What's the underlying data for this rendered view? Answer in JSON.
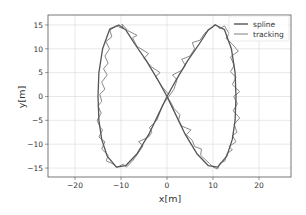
{
  "chart_data": {
    "type": "line",
    "title": "",
    "xlabel": "x[m]",
    "ylabel": "y[m]",
    "xlim": [
      -26,
      27
    ],
    "ylim": [
      -17,
      17
    ],
    "xticks": [
      -20,
      -10,
      0,
      10,
      20
    ],
    "yticks": [
      -15,
      -10,
      -5,
      0,
      5,
      10,
      15
    ],
    "xtick_labels": [
      "−20",
      "−10",
      "0",
      "10",
      "20"
    ],
    "ytick_labels": [
      "−15",
      "−10",
      "−5",
      "0",
      "5",
      "10",
      "15"
    ],
    "grid": true,
    "legend_position": "upper right",
    "series": [
      {
        "name": "spline",
        "color": "#555555",
        "width": 1.3,
        "points": [
          [
            0,
            0
          ],
          [
            -2,
            3.5
          ],
          [
            -4.5,
            7.5
          ],
          [
            -7,
            11
          ],
          [
            -9,
            14
          ],
          [
            -10.5,
            15
          ],
          [
            -12.5,
            14
          ],
          [
            -14,
            10
          ],
          [
            -14.8,
            5
          ],
          [
            -15,
            0
          ],
          [
            -14.8,
            -5
          ],
          [
            -14.2,
            -9
          ],
          [
            -13,
            -12.5
          ],
          [
            -11,
            -14.8
          ],
          [
            -9,
            -14.5
          ],
          [
            -6.5,
            -12
          ],
          [
            -4,
            -8
          ],
          [
            -2,
            -4
          ],
          [
            0,
            0
          ],
          [
            2,
            3.5
          ],
          [
            4.5,
            7.5
          ],
          [
            7,
            11
          ],
          [
            9,
            14
          ],
          [
            10.5,
            15
          ],
          [
            12.5,
            14
          ],
          [
            14,
            10
          ],
          [
            14.8,
            5
          ],
          [
            15,
            0
          ],
          [
            14.8,
            -5
          ],
          [
            14.2,
            -9
          ],
          [
            13,
            -12.5
          ],
          [
            11,
            -14.8
          ],
          [
            9,
            -14.5
          ],
          [
            6.5,
            -12
          ],
          [
            4,
            -8
          ],
          [
            2,
            -4
          ],
          [
            0,
            0
          ]
        ]
      },
      {
        "name": "tracking",
        "color": "#8a8a8a",
        "width": 1.0,
        "points": [
          [
            0.3,
            0.5
          ],
          [
            -1,
            2
          ],
          [
            -2.5,
            4.2
          ],
          [
            -1.5,
            5
          ],
          [
            -3.5,
            6.3
          ],
          [
            -5,
            8
          ],
          [
            -4,
            9
          ],
          [
            -6.5,
            10.5
          ],
          [
            -7.5,
            12.3
          ],
          [
            -6.5,
            12.8
          ],
          [
            -8.5,
            13.8
          ],
          [
            -9.8,
            15.2
          ],
          [
            -9.5,
            14.2
          ],
          [
            -11,
            14.8
          ],
          [
            -12.5,
            14.2
          ],
          [
            -12,
            12.5
          ],
          [
            -13.3,
            11.5
          ],
          [
            -12.5,
            10
          ],
          [
            -13.5,
            8.5
          ],
          [
            -12.8,
            7
          ],
          [
            -13.8,
            5.8
          ],
          [
            -13,
            4.5
          ],
          [
            -14.2,
            3
          ],
          [
            -13.5,
            1.5
          ],
          [
            -14.6,
            0.5
          ],
          [
            -14.2,
            -1
          ],
          [
            -15,
            -2
          ],
          [
            -14.3,
            -3.5
          ],
          [
            -15.2,
            -5
          ],
          [
            -14.5,
            -6.5
          ],
          [
            -14,
            -7
          ],
          [
            -14.8,
            -8.5
          ],
          [
            -13.5,
            -9.5
          ],
          [
            -14.2,
            -11
          ],
          [
            -12.8,
            -12.3
          ],
          [
            -13.2,
            -13.5
          ],
          [
            -12,
            -14
          ],
          [
            -10.8,
            -14.8
          ],
          [
            -9.5,
            -14.2
          ],
          [
            -8.8,
            -14.8
          ],
          [
            -7.5,
            -13.5
          ],
          [
            -6.8,
            -12.6
          ],
          [
            -5.8,
            -11.2
          ],
          [
            -5.2,
            -10.3
          ],
          [
            -6.2,
            -9.5
          ],
          [
            -4,
            -8.5
          ],
          [
            -3.3,
            -7.5
          ],
          [
            -3.8,
            -6.5
          ],
          [
            -2.2,
            -5
          ],
          [
            -1.5,
            -3.2
          ],
          [
            -0.8,
            -1.5
          ],
          [
            0.2,
            -0.3
          ],
          [
            1.5,
            1.5
          ],
          [
            2.2,
            3.5
          ],
          [
            1.2,
            4.5
          ],
          [
            3.2,
            5.5
          ],
          [
            4,
            6.5
          ],
          [
            3.2,
            7.8
          ],
          [
            5,
            8.5
          ],
          [
            6,
            10
          ],
          [
            5.5,
            11.3
          ],
          [
            7.2,
            11.8
          ],
          [
            8.2,
            13.3
          ],
          [
            9.5,
            14.2
          ],
          [
            10.5,
            15.2
          ],
          [
            11.5,
            14.2
          ],
          [
            12.5,
            14.8
          ],
          [
            13.5,
            13.2
          ],
          [
            12.8,
            12.2
          ],
          [
            14.2,
            11
          ],
          [
            15.5,
            9.5
          ],
          [
            13.8,
            8.3
          ],
          [
            14.6,
            6.5
          ],
          [
            13.8,
            5.2
          ],
          [
            15,
            4
          ],
          [
            14.2,
            2.5
          ],
          [
            15.8,
            1
          ],
          [
            14.5,
            0
          ],
          [
            15.3,
            -1.5
          ],
          [
            14.4,
            -3
          ],
          [
            15.8,
            -4.5
          ],
          [
            14.6,
            -5.8
          ],
          [
            15.2,
            -7.5
          ],
          [
            14.2,
            -8.2
          ],
          [
            15,
            -9.5
          ],
          [
            13.5,
            -10.5
          ],
          [
            14.2,
            -11.2
          ],
          [
            13,
            -12
          ],
          [
            12.6,
            -13.5
          ],
          [
            11.5,
            -14
          ],
          [
            11,
            -15.2
          ],
          [
            10,
            -14.8
          ],
          [
            9.2,
            -14
          ],
          [
            8.3,
            -13.2
          ],
          [
            7.3,
            -12.3
          ],
          [
            7.5,
            -11
          ],
          [
            6,
            -10.5
          ],
          [
            5.5,
            -9.2
          ],
          [
            4.2,
            -8
          ],
          [
            5.2,
            -7
          ],
          [
            3.2,
            -6.2
          ],
          [
            2.5,
            -5
          ],
          [
            2.8,
            -3.8
          ],
          [
            1.5,
            -2.5
          ],
          [
            0.8,
            -1.2
          ],
          [
            0,
            0
          ]
        ]
      }
    ]
  },
  "legend": {
    "items": [
      {
        "label": "spline",
        "color": "#555555"
      },
      {
        "label": "tracking",
        "color": "#8a8a8a"
      }
    ]
  }
}
